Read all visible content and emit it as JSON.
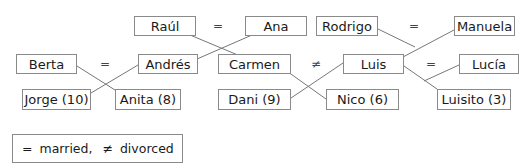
{
  "diagram": {
    "type": "family-tree",
    "people": {
      "raul": "Raúl",
      "ana": "Ana",
      "rodrigo": "Rodrigo",
      "manuela": "Manuela",
      "berta": "Berta",
      "andres": "Andrés",
      "carmen": "Carmen",
      "luis": "Luis",
      "lucia": "Lucía",
      "jorge": "Jorge (10)",
      "anita": "Anita (8)",
      "dani": "Dani (9)",
      "nico": "Nico (6)",
      "luisito": "Luisito (3)"
    },
    "relations": {
      "raul_ana": "=",
      "rodrigo_manuela": "=",
      "berta_andres": "=",
      "carmen_luis": "≠",
      "luis_lucia": "="
    },
    "edges": [
      {
        "from": "Raúl = Ana",
        "to": [
          "Andrés",
          "Carmen"
        ]
      },
      {
        "from": "Rodrigo = Manuela",
        "to": [
          "Luis"
        ]
      },
      {
        "from": "Berta = Andrés",
        "to": [
          "Jorge (10)",
          "Anita (8)"
        ]
      },
      {
        "from": "Carmen ≠ Luis",
        "to": [
          "Dani (9)",
          "Nico (6)"
        ]
      },
      {
        "from": "Luis = Lucía",
        "to": [
          "Luisito (3)"
        ]
      }
    ]
  },
  "legend": {
    "married_symbol": "=",
    "married_label": "married,",
    "divorced_symbol": "≠",
    "divorced_label": "divorced"
  }
}
